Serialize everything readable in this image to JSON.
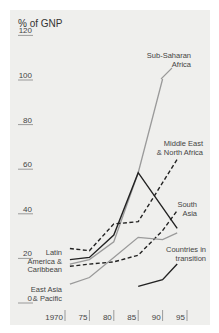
{
  "chart_data": {
    "type": "line",
    "title": "",
    "ylabel": "% of GNP",
    "xlabel": "",
    "ylim": [
      0,
      120
    ],
    "xlim": [
      1970,
      1995
    ],
    "y_ticks": [
      "0",
      "20",
      "40",
      "60",
      "80",
      "100",
      "120"
    ],
    "y_tick_values": [
      0,
      20,
      40,
      60,
      80,
      100,
      120
    ],
    "x_ticks": [
      "1970",
      "75",
      "80",
      "85",
      "90",
      "95"
    ],
    "x_tick_values": [
      1970,
      1975,
      1980,
      1985,
      1990,
      1995
    ],
    "grid": false,
    "series": [
      {
        "name": "Sub-Saharan Africa",
        "label_lines": [
          "Sub-Saharan",
          "Africa"
        ],
        "style": "gray-solid",
        "color": "#9a9a9a",
        "x": [
          1971,
          1975,
          1980,
          1985,
          1990
        ],
        "values": [
          17,
          19,
          27,
          58,
          100
        ]
      },
      {
        "name": "Latin America & Caribbean",
        "label_lines": [
          "Latin",
          "America &",
          "Caribbean"
        ],
        "style": "black-solid",
        "color": "#222222",
        "x": [
          1971,
          1975,
          1980,
          1985,
          1993
        ],
        "values": [
          19,
          20,
          30,
          58,
          33
        ]
      },
      {
        "name": "Middle East & North Africa",
        "label_lines": [
          "Middle East",
          "& North Africa"
        ],
        "style": "black-dashed",
        "color": "#222222",
        "x": [
          1971,
          1975,
          1980,
          1985,
          1993
        ],
        "values": [
          24,
          23,
          35,
          36,
          64
        ]
      },
      {
        "name": "South Asia",
        "label_lines": [
          "South",
          "Asia"
        ],
        "style": "black-dashed",
        "color": "#222222",
        "x": [
          1971,
          1975,
          1980,
          1985,
          1990,
          1993
        ],
        "values": [
          16,
          17,
          18,
          21,
          32,
          41
        ]
      },
      {
        "name": "East Asia & Pacific",
        "label_lines": [
          "East Asia",
          "& Pacific"
        ],
        "style": "gray-solid",
        "color": "#9a9a9a",
        "x": [
          1971,
          1975,
          1980,
          1985,
          1990,
          1993
        ],
        "values": [
          8,
          11,
          20,
          29,
          28,
          31
        ]
      },
      {
        "name": "Countries in transition",
        "label_lines": [
          "Countries in",
          "transition"
        ],
        "style": "black-solid",
        "color": "#222222",
        "x": [
          1985,
          1990,
          1993
        ],
        "values": [
          7,
          10,
          17
        ]
      }
    ]
  }
}
